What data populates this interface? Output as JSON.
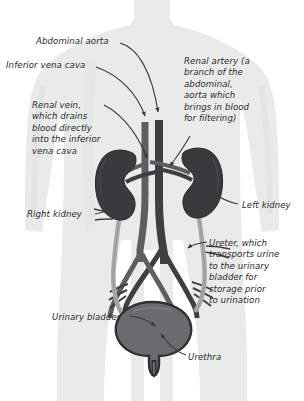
{
  "diagram": {
    "colors": {
      "background": "#ffffff",
      "body_silhouette": "#e9eaea",
      "body_silhouette_shadow": "#dedfdf",
      "kidney": "#3a3a3c",
      "kidney_outline": "#2a2a2c",
      "artery": "#4a4a4c",
      "vein": "#5e5e60",
      "ureter": "#a9a9ab",
      "bladder_fill": "#6b6b6d",
      "bladder_outline": "#2f2f31",
      "leader_line": "#3a3a3a",
      "text": "#2b2b2b"
    },
    "labels": [
      {
        "id": "abdominal-aorta",
        "name": "label-abdominal-aorta",
        "lines": [
          "Abdominal aorta"
        ],
        "x": 36,
        "y": 36,
        "align": "left"
      },
      {
        "id": "inferior-vena-cava",
        "name": "label-inferior-vena-cava",
        "lines": [
          "Inferior vena cava"
        ],
        "x": 6,
        "y": 60,
        "align": "left"
      },
      {
        "id": "renal-vein",
        "name": "label-renal-vein",
        "lines": [
          "Renal vein,",
          "which drains",
          "blood directly",
          "into the inferior",
          "vena cava"
        ],
        "x": 32,
        "y": 100,
        "align": "left"
      },
      {
        "id": "renal-artery",
        "name": "label-renal-artery",
        "lines": [
          "Renal artery (a",
          "branch of the",
          "abdominal,",
          "aorta which",
          "brings in blood",
          "for filtering)",
          ""
        ],
        "x": 184,
        "y": 56,
        "align": "left"
      },
      {
        "id": "right-kidney",
        "name": "label-right-kidney",
        "lines": [
          "Right kidney"
        ],
        "x": 27,
        "y": 209,
        "align": "left"
      },
      {
        "id": "left-kidney",
        "name": "label-left-kidney",
        "lines": [
          "Left kidney"
        ],
        "x": 242,
        "y": 200,
        "align": "left"
      },
      {
        "id": "ureter",
        "name": "label-ureter",
        "lines": [
          "Ureter, which",
          "transports urine",
          "to the urinary",
          "bladder for",
          "storage prior",
          "to urination"
        ],
        "x": 209,
        "y": 238,
        "align": "left"
      },
      {
        "id": "urinary-bladder",
        "name": "label-urinary-bladder",
        "lines": [
          "Urinary bladder"
        ],
        "x": 52,
        "y": 312,
        "align": "left"
      },
      {
        "id": "urethra",
        "name": "label-urethra",
        "lines": [
          "Urethra"
        ],
        "x": 188,
        "y": 352,
        "align": "left"
      }
    ],
    "parts": [
      {
        "id": "abdominal-aorta",
        "label": "Abdominal aorta"
      },
      {
        "id": "inferior-vena-cava",
        "label": "Inferior vena cava"
      },
      {
        "id": "renal-vein",
        "label": "Renal vein"
      },
      {
        "id": "renal-artery",
        "label": "Renal artery"
      },
      {
        "id": "right-kidney",
        "label": "Right kidney"
      },
      {
        "id": "left-kidney",
        "label": "Left kidney"
      },
      {
        "id": "ureter",
        "label": "Ureter"
      },
      {
        "id": "urinary-bladder",
        "label": "Urinary bladder"
      },
      {
        "id": "urethra",
        "label": "Urethra"
      }
    ]
  }
}
